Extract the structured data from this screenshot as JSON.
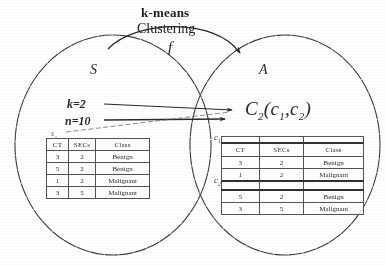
{
  "diagram": {
    "title_lines": {
      "line1": "k-means",
      "line2": "Clustering",
      "function_symbol": "f"
    },
    "source_set": {
      "label": "S",
      "table_caption": "s",
      "table_caption_sub": "2",
      "params": {
        "k": "k=2",
        "n": "n=10"
      },
      "table": {
        "headers": [
          "CT",
          "SECs",
          "Class"
        ],
        "rows": [
          [
            "3",
            "2",
            "Benign"
          ],
          [
            "5",
            "2",
            "Benign"
          ],
          [
            "1",
            "2",
            "Malignant"
          ],
          [
            "3",
            "5",
            "Malignant"
          ]
        ]
      }
    },
    "target_set": {
      "label": "A",
      "result_expression": {
        "main": "C",
        "main_sub": "2",
        "open": "(",
        "arg1": "c",
        "arg1_sub": "1",
        "comma": ",",
        "arg2": "c",
        "arg2_sub": "2",
        "close": ")"
      },
      "cluster_labels": {
        "c1": "c",
        "c1_sub": "1",
        "c2": "c",
        "c2_sub": "2"
      },
      "table": {
        "headers": [
          "CT",
          "SECs",
          "Class"
        ],
        "cluster1_rows": [
          [
            "3",
            "2",
            "Benign"
          ],
          [
            "1",
            "2",
            "Malignant"
          ]
        ],
        "cluster2_rows": [
          [
            "5",
            "2",
            "Benign"
          ],
          [
            "3",
            "5",
            "Malignant"
          ]
        ]
      }
    },
    "colors": {
      "ink": "#2b2b2b",
      "background": "#fdfdfc",
      "rule": "#555555"
    }
  }
}
